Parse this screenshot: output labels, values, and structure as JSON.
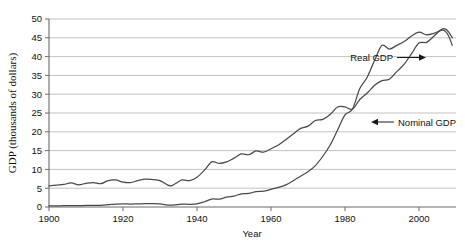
{
  "chart_data": {
    "type": "line",
    "title": "",
    "xlabel": "Year",
    "ylabel": "GDP (thousands of dollars)",
    "xlim": [
      1900,
      2010
    ],
    "ylim": [
      0,
      50
    ],
    "xticks": [
      1900,
      1920,
      1940,
      1960,
      1980,
      2000
    ],
    "yticks": [
      0,
      5,
      10,
      15,
      20,
      25,
      30,
      35,
      40,
      45,
      50
    ],
    "grid": "horizontal",
    "legend_position": "inline-annotations",
    "annotations": [
      {
        "name": "real-gdp-label",
        "text": "Real GDP",
        "arrow": "right",
        "x": 1975,
        "y": 33
      },
      {
        "name": "nominal-gdp-label",
        "text": "Nominal GDP",
        "arrow": "left",
        "x": 1995,
        "y": 22
      }
    ],
    "x": [
      1900,
      1902,
      1904,
      1906,
      1908,
      1910,
      1912,
      1914,
      1916,
      1918,
      1920,
      1922,
      1924,
      1926,
      1928,
      1930,
      1932,
      1933,
      1934,
      1936,
      1938,
      1940,
      1942,
      1944,
      1946,
      1948,
      1950,
      1952,
      1954,
      1956,
      1958,
      1960,
      1962,
      1964,
      1966,
      1968,
      1970,
      1972,
      1974,
      1976,
      1978,
      1980,
      1982,
      1984,
      1986,
      1988,
      1990,
      1992,
      1994,
      1996,
      1998,
      2000,
      2002,
      2004,
      2006,
      2007,
      2008,
      2009
    ],
    "series": [
      {
        "name": "Real GDP",
        "values": [
          5.6,
          5.8,
          6.0,
          6.4,
          5.9,
          6.3,
          6.5,
          6.2,
          7.0,
          7.2,
          6.6,
          6.5,
          7.0,
          7.4,
          7.3,
          7.0,
          5.9,
          5.6,
          6.1,
          7.2,
          7.0,
          7.9,
          9.8,
          12.0,
          11.6,
          12.0,
          13.0,
          14.1,
          13.9,
          14.9,
          14.6,
          15.5,
          16.5,
          17.9,
          19.4,
          20.9,
          21.5,
          23.0,
          23.3,
          24.6,
          26.6,
          26.6,
          26.0,
          28.6,
          30.3,
          32.4,
          33.6,
          34.0,
          36.0,
          38.0,
          40.8,
          43.6,
          43.8,
          45.4,
          47.2,
          47.4,
          46.6,
          45.0
        ]
      },
      {
        "name": "Nominal GDP",
        "values": [
          0.28,
          0.31,
          0.34,
          0.38,
          0.36,
          0.42,
          0.46,
          0.45,
          0.6,
          0.78,
          0.86,
          0.78,
          0.83,
          0.9,
          0.9,
          0.82,
          0.52,
          0.48,
          0.56,
          0.74,
          0.72,
          0.85,
          1.4,
          2.1,
          2.1,
          2.6,
          2.9,
          3.5,
          3.6,
          4.1,
          4.2,
          4.7,
          5.2,
          5.9,
          7.0,
          8.2,
          9.4,
          11.0,
          13.5,
          16.5,
          20.5,
          24.5,
          26.0,
          31.5,
          34.5,
          39.0,
          43.0,
          42.0,
          43.0,
          44.0,
          45.5,
          46.5,
          45.8,
          46.2,
          47.0,
          46.8,
          45.5,
          43.0
        ]
      }
    ],
    "note_series_crossing": "Real GDP and Nominal GDP converge near 2006-2007"
  }
}
